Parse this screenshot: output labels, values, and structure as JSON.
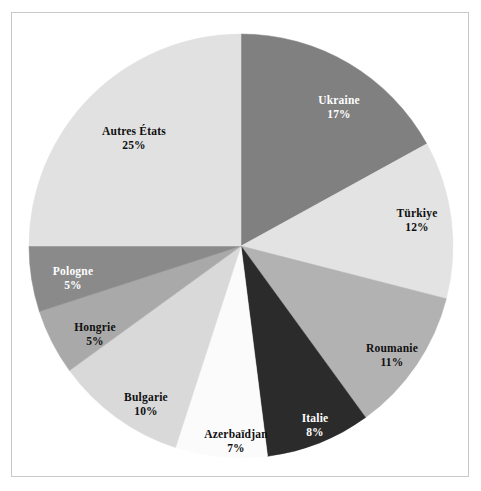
{
  "figure": {
    "background_color": "#ffffff",
    "frame_color": "#c9c9c9"
  },
  "chart_data": {
    "type": "pie",
    "title": "",
    "subtitle": "",
    "xlabel": "",
    "ylabel": "",
    "legend_position": "none",
    "grid": false,
    "label_format": "name + percent",
    "start_angle_deg": 0,
    "direction": "clockwise",
    "categories": [
      "Ukraine",
      "Türkiye",
      "Roumanie",
      "Italie",
      "Azerbaïdjan",
      "Bulgarie",
      "Hongrie",
      "Pologne",
      "Autres États"
    ],
    "values": [
      17,
      12,
      11,
      8,
      7,
      10,
      5,
      5,
      25
    ],
    "total": 100,
    "unit": "%",
    "slices": [
      {
        "name": "Ukraine",
        "value": 17,
        "percent_label": "17%",
        "color": "#808080",
        "text_color": "#ffffff",
        "label_x": 339,
        "label_y": 107
      },
      {
        "name": "Türkiye",
        "value": 12,
        "percent_label": "12%",
        "color": "#e3e3e3",
        "text_color": "#101010",
        "label_x": 417,
        "label_y": 220
      },
      {
        "name": "Roumanie",
        "value": 11,
        "percent_label": "11%",
        "color": "#b2b2b2",
        "text_color": "#101010",
        "label_x": 392,
        "label_y": 355
      },
      {
        "name": "Italie",
        "value": 8,
        "percent_label": "8%",
        "color": "#2b2b2b",
        "text_color": "#ffffff",
        "label_x": 315,
        "label_y": 425
      },
      {
        "name": "Azerbaïdjan",
        "value": 7,
        "percent_label": "7%",
        "color": "#fbfbfb",
        "text_color": "#101010",
        "label_x": 236,
        "label_y": 441
      },
      {
        "name": "Bulgarie",
        "value": 10,
        "percent_label": "10%",
        "color": "#d9d9d9",
        "text_color": "#101010",
        "label_x": 146,
        "label_y": 404
      },
      {
        "name": "Hongrie",
        "value": 5,
        "percent_label": "5%",
        "color": "#a9a9a9",
        "text_color": "#101010",
        "label_x": 95,
        "label_y": 334
      },
      {
        "name": "Pologne",
        "value": 5,
        "percent_label": "5%",
        "color": "#8a8a8a",
        "text_color": "#ffffff",
        "label_x": 73,
        "label_y": 278
      },
      {
        "name": "Autres États",
        "value": 25,
        "percent_label": "25%",
        "color": "#e1e1e1",
        "text_color": "#101010",
        "label_x": 134,
        "label_y": 138
      }
    ],
    "geometry": {
      "center_x": 241,
      "center_y": 246,
      "radius": 212
    }
  }
}
